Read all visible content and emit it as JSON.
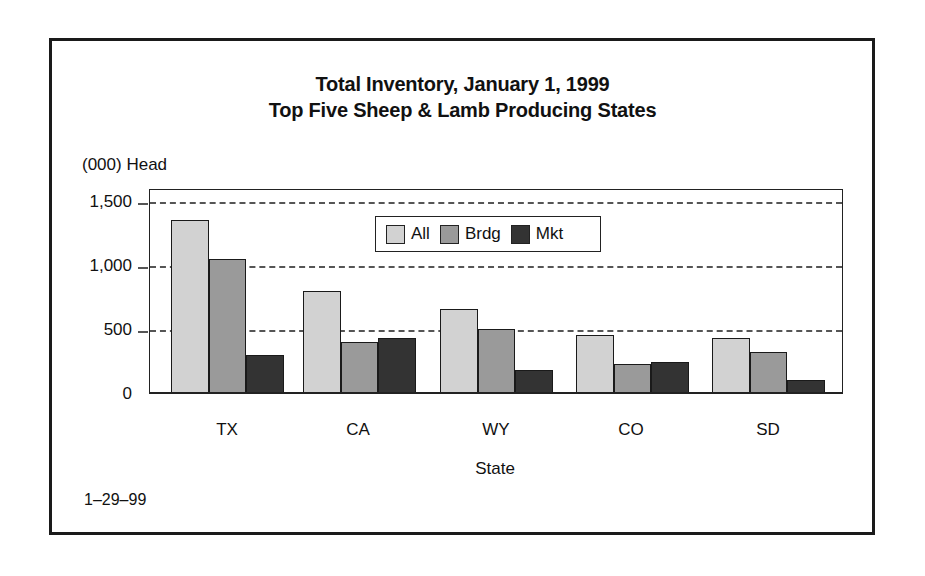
{
  "chart_data": {
    "type": "bar",
    "title": "Total Inventory, January 1, 1999",
    "subtitle": "Top Five Sheep & Lamb Producing States",
    "xlabel": "State",
    "ylabel": "(000) Head",
    "categories": [
      "TX",
      "CA",
      "WY",
      "CO",
      "SD"
    ],
    "series": [
      {
        "name": "All",
        "color": "#d2d2d2",
        "values": [
          1350,
          800,
          660,
          450,
          430
        ]
      },
      {
        "name": "Brdg",
        "color": "#9a9a9a",
        "values": [
          1050,
          400,
          500,
          230,
          320
        ]
      },
      {
        "name": "Mkt",
        "color": "#333333",
        "values": [
          300,
          430,
          180,
          240,
          100
        ]
      }
    ],
    "ylim": [
      0,
      1600
    ],
    "yticks": [
      0,
      500,
      1000,
      1500
    ],
    "ytick_labels": [
      "0",
      "500",
      "1,000",
      "1,500"
    ],
    "grid": true,
    "legend_position": "top-center inside plot",
    "footnote": "1–29–99"
  },
  "labels": {
    "title_line1": "Total Inventory, January 1, 1999",
    "title_line2": "Top Five Sheep & Lamb Producing States",
    "ylabel": "(000) Head",
    "xlabel": "State",
    "footnote": "1–29–99",
    "yticks": [
      "0",
      "500",
      "1,000",
      "1,500"
    ],
    "xticks": [
      "TX",
      "CA",
      "WY",
      "CO",
      "SD"
    ],
    "legend": [
      "All",
      "Brdg",
      "Mkt"
    ]
  }
}
